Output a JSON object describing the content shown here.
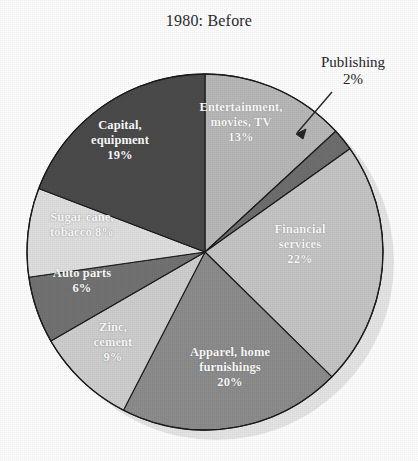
{
  "chart_data": {
    "type": "pie",
    "title": "1980: Before",
    "xlabel": "",
    "ylabel": "",
    "legend_position": "none",
    "grid": false,
    "value_unit": "percent",
    "start_angle_deg": 0,
    "direction": "clockwise",
    "categories": [
      "Entertainment, movies, TV",
      "Publishing",
      "Financial services",
      "Apparel, home furnishings",
      "Zinc, cement",
      "Auto parts",
      "Sugar cane, tobacco",
      "Capital, equipment"
    ],
    "values": [
      13,
      2,
      22,
      20,
      9,
      6,
      8,
      19
    ],
    "slices": [
      {
        "name": "Entertainment, movies, TV",
        "label_line1": "Entertainment,",
        "label_line2": "movies, TV",
        "percent_text": "13%",
        "value": 13,
        "fill": "#b9b9b9",
        "label_color": "#ffffff",
        "label_placement": "inside"
      },
      {
        "name": "Publishing",
        "label_line1": "Publishing",
        "label_line2": "",
        "percent_text": "2%",
        "value": 2,
        "fill": "#6f6f6f",
        "label_color": "#262626",
        "label_placement": "callout"
      },
      {
        "name": "Financial services",
        "label_line1": "Financial",
        "label_line2": "services",
        "percent_text": "22%",
        "value": 22,
        "fill": "#c6c6c6",
        "label_color": "#ffffff",
        "label_placement": "inside"
      },
      {
        "name": "Apparel, home furnishings",
        "label_line1": "Apparel, home",
        "label_line2": "furnishings",
        "percent_text": "20%",
        "value": 20,
        "fill": "#8d8d8d",
        "label_color": "#ffffff",
        "label_placement": "inside"
      },
      {
        "name": "Zinc, cement",
        "label_line1": "Zinc,",
        "label_line2": "cement",
        "percent_text": "9%",
        "value": 9,
        "fill": "#cfcfcf",
        "label_color": "#ffffff",
        "label_placement": "inside"
      },
      {
        "name": "Auto parts",
        "label_line1": "Auto parts",
        "label_line2": "",
        "percent_text": "6%",
        "value": 6,
        "fill": "#737373",
        "label_color": "#ffffff",
        "label_placement": "inside"
      },
      {
        "name": "Sugar cane, tobacco",
        "label_line1": "Sugar cane,",
        "label_line2": "tobacco 8%",
        "percent_text": "",
        "value": 8,
        "fill": "#e0e0e0",
        "label_color": "#ffffff",
        "label_placement": "inside"
      },
      {
        "name": "Capital, equipment",
        "label_line1": "Capital,",
        "label_line2": "equipment",
        "percent_text": "19%",
        "value": 19,
        "fill": "#4b4b4b",
        "label_color": "#ffffff",
        "label_placement": "inside"
      }
    ]
  },
  "colors": {
    "title_text": "#2b2b2b",
    "callout_text": "#262626",
    "slice_outline": "#1a1a1a",
    "shadow": "#e3e3e3",
    "background": "#ffffff"
  },
  "callout": {
    "publishing": {
      "line1": "Publishing",
      "percent_text": "2%"
    }
  }
}
